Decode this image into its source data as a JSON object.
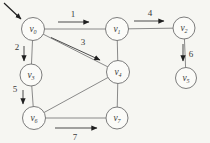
{
  "colors": {
    "background": "#f6f6f2",
    "edge": "#7d7d7d",
    "node_fill": "#fbfbf8",
    "node_stroke": "#6e6e6e",
    "arrow_shaft": "#4b4b4b",
    "arrow_head": "#1f1f1f",
    "label": "#3a3a3a"
  },
  "graph": {
    "type": "undirected-graph-with-visit-order",
    "nodes": [
      {
        "id": "v0",
        "base": "v",
        "sub": "0",
        "x": 33,
        "y": 29,
        "r": 11.5
      },
      {
        "id": "v1",
        "base": "v",
        "sub": "1",
        "x": 117,
        "y": 29,
        "r": 11.5
      },
      {
        "id": "v2",
        "base": "v",
        "sub": "2",
        "x": 184,
        "y": 28,
        "r": 11
      },
      {
        "id": "v3",
        "base": "v",
        "sub": "3",
        "x": 31,
        "y": 75,
        "r": 11
      },
      {
        "id": "v4",
        "base": "v",
        "sub": "4",
        "x": 118,
        "y": 72,
        "r": 11.5
      },
      {
        "id": "v5",
        "base": "v",
        "sub": "5",
        "x": 186,
        "y": 78,
        "r": 10.5
      },
      {
        "id": "v6",
        "base": "v",
        "sub": "6",
        "x": 34,
        "y": 118,
        "r": 11.5
      },
      {
        "id": "v7",
        "base": "v",
        "sub": "7",
        "x": 117,
        "y": 118,
        "r": 11
      }
    ],
    "edges": [
      {
        "from": "v0",
        "to": "v1"
      },
      {
        "from": "v0",
        "to": "v3"
      },
      {
        "from": "v0",
        "to": "v4"
      },
      {
        "from": "v1",
        "to": "v2"
      },
      {
        "from": "v1",
        "to": "v4"
      },
      {
        "from": "v2",
        "to": "v5"
      },
      {
        "from": "v3",
        "to": "v6"
      },
      {
        "from": "v4",
        "to": "v6"
      },
      {
        "from": "v4",
        "to": "v7"
      },
      {
        "from": "v6",
        "to": "v7"
      }
    ],
    "visit_order_arrows": [
      {
        "label": "1",
        "from": "v0",
        "to": "v1",
        "x1": 58,
        "y1": 22,
        "x2": 89,
        "y2": 22,
        "label_x": 73,
        "label_y": 17
      },
      {
        "label": "2",
        "from": "v0",
        "to": "v3",
        "x1": 24,
        "y1": 46,
        "x2": 24,
        "y2": 61,
        "label_x": 17,
        "label_y": 50
      },
      {
        "label": "3",
        "from": "v0",
        "to": "v4",
        "x1": 51,
        "y1": 37.5,
        "x2": 100,
        "y2": 60,
        "label_x": 83,
        "label_y": 45
      },
      {
        "label": "4",
        "from": "v1",
        "to": "v2",
        "x1": 134,
        "y1": 21,
        "x2": 164,
        "y2": 21,
        "label_x": 150,
        "label_y": 16
      },
      {
        "label": "5",
        "from": "v3",
        "to": "v6",
        "x1": 23,
        "y1": 90,
        "x2": 23,
        "y2": 104,
        "label_x": 15,
        "label_y": 92
      },
      {
        "label": "6",
        "from": "v2",
        "to": "v5",
        "x1": 183,
        "y1": 44,
        "x2": 183,
        "y2": 61,
        "label_x": 191,
        "label_y": 57
      },
      {
        "label": "7",
        "from": "v6",
        "to": "v7",
        "x1": 55,
        "y1": 128,
        "x2": 97,
        "y2": 128,
        "label_x": 75,
        "label_y": 140
      }
    ],
    "start_arrow": {
      "target": "v0",
      "x1": 4,
      "y1": 3,
      "x2": 21,
      "y2": 19
    }
  }
}
